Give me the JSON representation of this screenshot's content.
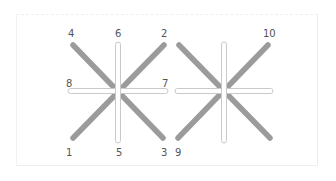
{
  "diagram": {
    "colors": {
      "diagonal_bar": "#9b9b9b",
      "straight_bar_fill": "#ffffff",
      "straight_bar_stroke": "#c9c9c9",
      "label": "#555555",
      "frame": "#eeeeee"
    },
    "figures": [
      {
        "name": "left-star",
        "diagonals": [
          {
            "x1": 73,
            "y1": 45,
            "x2": 163,
            "y2": 138
          },
          {
            "x1": 164,
            "y1": 45,
            "x2": 73,
            "y2": 138
          }
        ],
        "vertical": {
          "x": 118,
          "y1": 42,
          "y2": 143
        },
        "horizontal": {
          "y": 91,
          "x1": 68,
          "x2": 168
        }
      },
      {
        "name": "right-star",
        "diagonals": [
          {
            "x1": 179,
            "y1": 45,
            "x2": 270,
            "y2": 138
          },
          {
            "x1": 268,
            "y1": 45,
            "x2": 178,
            "y2": 138
          }
        ],
        "vertical": {
          "x": 224,
          "y1": 42,
          "y2": 143
        },
        "horizontal": {
          "y": 91,
          "x1": 175,
          "x2": 273
        }
      }
    ],
    "labels": [
      {
        "text": "4",
        "x": 68,
        "y": 37
      },
      {
        "text": "6",
        "x": 115,
        "y": 37
      },
      {
        "text": "2",
        "x": 161,
        "y": 37
      },
      {
        "text": "10",
        "x": 263,
        "y": 37
      },
      {
        "text": "8",
        "x": 66,
        "y": 87
      },
      {
        "text": "7",
        "x": 162,
        "y": 87
      },
      {
        "text": "1",
        "x": 66,
        "y": 156
      },
      {
        "text": "5",
        "x": 116,
        "y": 156
      },
      {
        "text": "3",
        "x": 161,
        "y": 156
      },
      {
        "text": "9",
        "x": 175,
        "y": 156
      }
    ]
  }
}
